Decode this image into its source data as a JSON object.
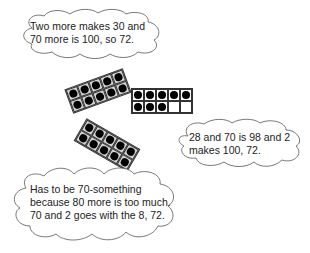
{
  "bubbles": [
    {
      "id": "top-left",
      "text": "Two more makes 30 and 70 more is 100, so 72.",
      "lines": [
        "Two more makes 30 and",
        "70 more is 100, so 72."
      ]
    },
    {
      "id": "right",
      "text": "28 and 70 is 98 and 2 makes 100, 72.",
      "lines": [
        "28 and 70 is 98 and 2",
        "makes 100, 72."
      ]
    },
    {
      "id": "bottom-left",
      "text": "Has to be 70-something because 80 more is too much. 70 and 2 goes with the 8, 72.",
      "lines": [
        "Has to be 70-something",
        "because 80 more is too much.",
        "70 and 2 goes with the 8, 72."
      ]
    }
  ],
  "ten_frames": [
    {
      "id": "grey-top",
      "fill": "#d4d4d4",
      "dots": 10,
      "rotation_deg": -20
    },
    {
      "id": "white-middle",
      "fill": "#ffffff",
      "dots": 8,
      "rotation_deg": 0
    },
    {
      "id": "grey-bottom",
      "fill": "#d4d4d4",
      "dots": 10,
      "rotation_deg": 30
    }
  ]
}
